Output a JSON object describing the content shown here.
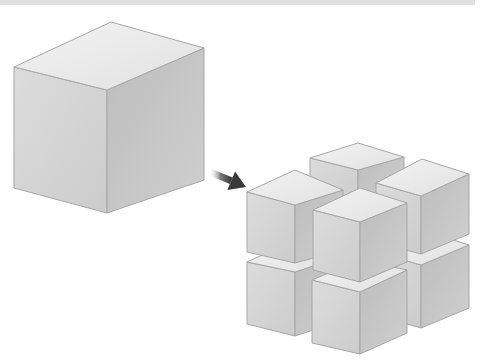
{
  "diagram": {
    "colors": {
      "background": "#ffffff",
      "top_bar": "#e0e0e0",
      "edge": "#a6a6a6",
      "top_face": "#ececec",
      "left_face": "#d6d6d6",
      "right_face": "#c2c2c2",
      "arrow": "#3a3a3a"
    },
    "large_cube": {
      "top": [
        [
          111,
          22
        ],
        [
          204,
          48
        ],
        [
          107,
          90
        ],
        [
          14,
          67
        ]
      ],
      "left": [
        [
          14,
          67
        ],
        [
          107,
          90
        ],
        [
          107,
          213
        ],
        [
          14,
          188
        ]
      ],
      "right": [
        [
          107,
          90
        ],
        [
          204,
          48
        ],
        [
          204,
          180
        ],
        [
          107,
          213
        ]
      ]
    },
    "arrow": {
      "from": [
        210,
        172
      ],
      "to": [
        246,
        187
      ]
    },
    "small_cubes": [
      {
        "name": "back-top",
        "top": [
          [
            358,
            143
          ],
          [
            404,
            157
          ],
          [
            358,
            170
          ],
          [
            310,
            158
          ]
        ],
        "left": [
          [
            310,
            158
          ],
          [
            358,
            170
          ],
          [
            358,
            200
          ],
          [
            310,
            188
          ]
        ],
        "right": [
          [
            358,
            170
          ],
          [
            404,
            157
          ],
          [
            404,
            188
          ],
          [
            358,
            200
          ]
        ]
      },
      {
        "name": "right-bottom",
        "top": [
          [
            422,
            230
          ],
          [
            469,
            245
          ],
          [
            421,
            265
          ],
          [
            376,
            252
          ]
        ],
        "left": [
          [
            376,
            252
          ],
          [
            421,
            265
          ],
          [
            421,
            328
          ],
          [
            376,
            315
          ]
        ],
        "right": [
          [
            421,
            265
          ],
          [
            469,
            245
          ],
          [
            469,
            308
          ],
          [
            421,
            328
          ]
        ]
      },
      {
        "name": "left-bottom",
        "top": [
          [
            295,
            240
          ],
          [
            343,
            256
          ],
          [
            295,
            272
          ],
          [
            247,
            262
          ]
        ],
        "left": [
          [
            247,
            262
          ],
          [
            295,
            272
          ],
          [
            295,
            336
          ],
          [
            247,
            324
          ]
        ],
        "right": [
          [
            295,
            272
          ],
          [
            343,
            256
          ],
          [
            343,
            320
          ],
          [
            295,
            336
          ]
        ]
      },
      {
        "name": "top-left",
        "top": [
          [
            295,
            170
          ],
          [
            343,
            190
          ],
          [
            295,
            205
          ],
          [
            247,
            192
          ]
        ],
        "left": [
          [
            247,
            192
          ],
          [
            295,
            205
          ],
          [
            295,
            263
          ],
          [
            247,
            252
          ]
        ],
        "right": [
          [
            295,
            205
          ],
          [
            343,
            190
          ],
          [
            343,
            250
          ],
          [
            295,
            263
          ]
        ]
      },
      {
        "name": "right-top",
        "top": [
          [
            422,
            159
          ],
          [
            469,
            174
          ],
          [
            421,
            196
          ],
          [
            376,
            183
          ]
        ],
        "left": [
          [
            376,
            183
          ],
          [
            421,
            196
          ],
          [
            421,
            254
          ],
          [
            376,
            242
          ]
        ],
        "right": [
          [
            421,
            196
          ],
          [
            469,
            174
          ],
          [
            469,
            234
          ],
          [
            421,
            254
          ]
        ]
      },
      {
        "name": "front-bottom",
        "top": [
          [
            360,
            260
          ],
          [
            407,
            270
          ],
          [
            360,
            292
          ],
          [
            312,
            280
          ]
        ],
        "left": [
          [
            312,
            280
          ],
          [
            360,
            292
          ],
          [
            360,
            354
          ],
          [
            312,
            343
          ]
        ],
        "right": [
          [
            360,
            292
          ],
          [
            407,
            270
          ],
          [
            407,
            333
          ],
          [
            360,
            354
          ]
        ]
      },
      {
        "name": "front-top",
        "top": [
          [
            360,
            188
          ],
          [
            407,
            203
          ],
          [
            360,
            222
          ],
          [
            313,
            210
          ]
        ],
        "left": [
          [
            313,
            210
          ],
          [
            360,
            222
          ],
          [
            360,
            282
          ],
          [
            313,
            270
          ]
        ],
        "right": [
          [
            360,
            222
          ],
          [
            407,
            203
          ],
          [
            407,
            262
          ],
          [
            360,
            282
          ]
        ]
      }
    ]
  }
}
